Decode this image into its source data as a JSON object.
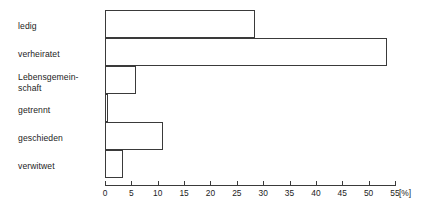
{
  "chart_data": {
    "type": "bar",
    "orientation": "horizontal",
    "title": "",
    "subtitle": "",
    "xlabel": "[%]",
    "ylabel": "",
    "unit": "[%]",
    "xlim": [
      0,
      55
    ],
    "xticks": [
      0,
      5,
      10,
      15,
      20,
      25,
      30,
      35,
      40,
      45,
      50,
      55
    ],
    "xtick_labels": [
      "0",
      "5",
      "10",
      "15",
      "20",
      "25",
      "30",
      "35",
      "40",
      "45",
      "50",
      "55"
    ],
    "grid": false,
    "legend": false,
    "categories": [
      "ledig",
      "verheiratet",
      "Lebensgemein-\nschaft",
      "getrennt",
      "geschieden",
      "verwitwet"
    ],
    "category_labels_plain": [
      "ledig",
      "verheiratet",
      "Lebensgemeinschaft",
      "getrennt",
      "geschieden",
      "verwitwet"
    ],
    "values": [
      28.5,
      53.5,
      5.8,
      0.5,
      11.0,
      3.5
    ],
    "series": [
      {
        "name": "Anteil",
        "values": [
          28.5,
          53.5,
          5.8,
          0.5,
          11.0,
          3.5
        ]
      }
    ],
    "colors": {
      "bar_fill": "#ffffff",
      "bar_stroke": "#3a3a3a",
      "axis": "#3a3a3a",
      "text": "#1c1c1c",
      "background": "#ffffff"
    }
  }
}
